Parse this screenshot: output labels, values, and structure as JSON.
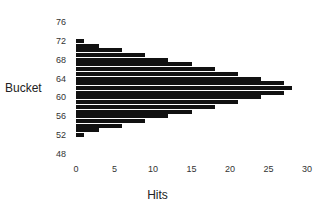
{
  "chart_data": {
    "type": "bar",
    "orientation": "horizontal",
    "title": "",
    "xlabel": "Hits",
    "ylabel": "Bucket",
    "xlim": [
      0,
      30
    ],
    "ylim": [
      48,
      76
    ],
    "xticks": [
      "0",
      "5",
      "10",
      "15",
      "20",
      "25",
      "30"
    ],
    "yticks": [
      "76",
      "72",
      "68",
      "64",
      "60",
      "56",
      "52",
      "48"
    ],
    "grid": false,
    "legend": null,
    "bar_color": "#111111",
    "categories": [
      72,
      71,
      70,
      69,
      68,
      67,
      66,
      65,
      64,
      63,
      62,
      61,
      60,
      59,
      58,
      57,
      56,
      55,
      54,
      53,
      52
    ],
    "values": [
      1,
      3,
      6,
      9,
      12,
      15,
      18,
      21,
      24,
      27,
      28,
      27,
      24,
      21,
      18,
      15,
      12,
      9,
      6,
      3,
      1
    ]
  }
}
